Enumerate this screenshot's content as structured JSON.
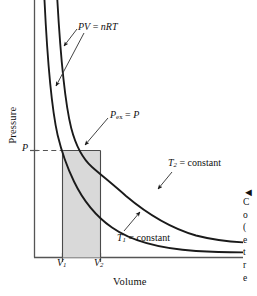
{
  "figure": {
    "kind": "pressure-volume-isotherm-diagram",
    "axes": {
      "ylabel": "Pressure",
      "xlabel": "Volume",
      "yticks": [
        "P"
      ],
      "xticks": [
        "V",
        "V"
      ],
      "xtick_subscripts": [
        "1",
        "2"
      ]
    },
    "annotations": {
      "ideal_gas_law": {
        "base": "PV",
        "equals": " = ",
        "rhs": "nRT"
      },
      "external_pressure": {
        "base": "P",
        "sub": "ex",
        "equals": " = ",
        "rhs": "P"
      },
      "upper_isotherm": {
        "base": "T",
        "sub": "2",
        "equals": " = ",
        "rhs": "constant"
      },
      "lower_isotherm": {
        "base": "T",
        "sub": "1",
        "equals": " = ",
        "rhs": "constant"
      }
    },
    "caption_clipped": {
      "arrow_glyph": "◄",
      "visible_line_fragments": [
        "C",
        "o",
        "(",
        "e",
        "t",
        "r",
        "e"
      ]
    },
    "colors": {
      "curve": "#1a1a1a",
      "axis": "#555555",
      "shaded_area": "#d9d9d9",
      "shaded_border": "#4a4a4a",
      "dashed_line": "#555555",
      "leader_line": "#3a3a3a",
      "background": "#ffffff"
    }
  }
}
